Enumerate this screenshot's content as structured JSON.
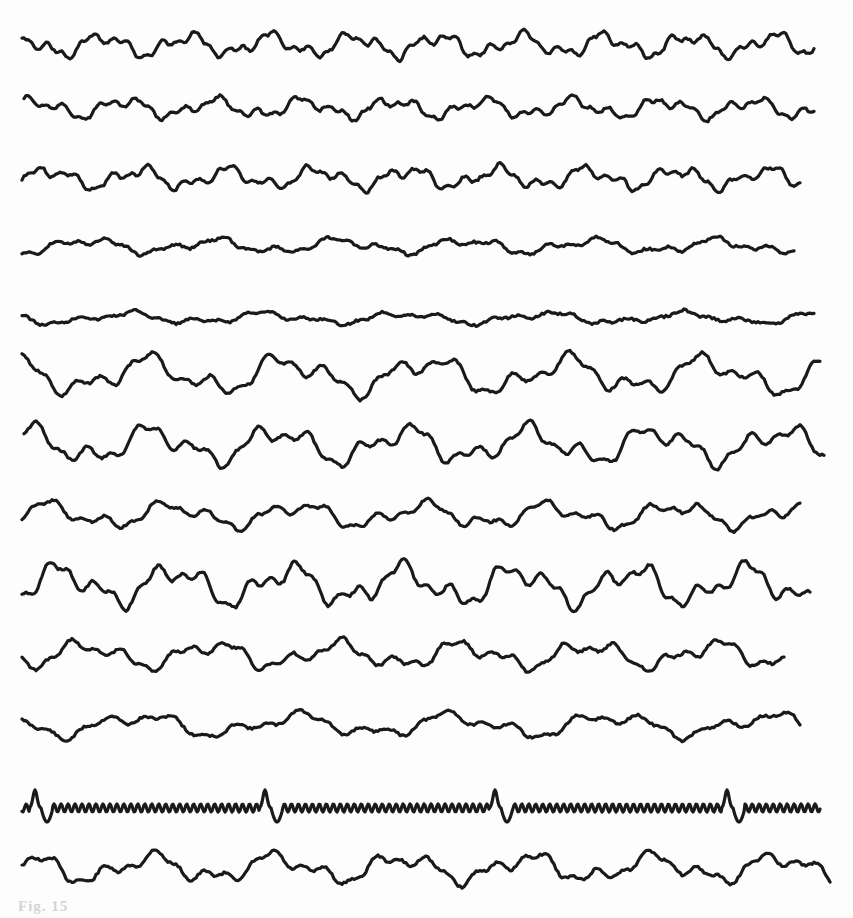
{
  "figure": {
    "caption": "Fig. 15",
    "trace_count": 13,
    "stroke_color": "#1a1a1a",
    "background_color": "#fdfdfd",
    "traces": [
      {
        "id": 1,
        "baseline": 45,
        "amp": 14,
        "seed": 1,
        "type": "eeg",
        "x_start": 22,
        "x_end": 815,
        "freq": 0.075
      },
      {
        "id": 2,
        "baseline": 108,
        "amp": 12,
        "seed": 2,
        "type": "eeg",
        "x_start": 24,
        "x_end": 815,
        "freq": 0.07
      },
      {
        "id": 3,
        "baseline": 178,
        "amp": 13,
        "seed": 3,
        "type": "eeg",
        "x_start": 22,
        "x_end": 800,
        "freq": 0.07
      },
      {
        "id": 4,
        "baseline": 246,
        "amp": 9,
        "seed": 4,
        "type": "eeg",
        "x_start": 22,
        "x_end": 795,
        "freq": 0.05
      },
      {
        "id": 5,
        "baseline": 318,
        "amp": 7,
        "seed": 5,
        "type": "eeg",
        "x_start": 22,
        "x_end": 815,
        "freq": 0.045
      },
      {
        "id": 6,
        "baseline": 375,
        "amp": 22,
        "seed": 6,
        "type": "eeg",
        "x_start": 22,
        "x_end": 820,
        "freq": 0.045
      },
      {
        "id": 7,
        "baseline": 445,
        "amp": 22,
        "seed": 7,
        "type": "eeg",
        "x_start": 24,
        "x_end": 825,
        "freq": 0.05
      },
      {
        "id": 8,
        "baseline": 515,
        "amp": 15,
        "seed": 8,
        "type": "eeg",
        "x_start": 22,
        "x_end": 800,
        "freq": 0.05
      },
      {
        "id": 9,
        "baseline": 585,
        "amp": 24,
        "seed": 9,
        "type": "eeg",
        "x_start": 22,
        "x_end": 810,
        "freq": 0.055
      },
      {
        "id": 10,
        "baseline": 655,
        "amp": 16,
        "seed": 10,
        "type": "eeg",
        "x_start": 22,
        "x_end": 785,
        "freq": 0.05
      },
      {
        "id": 11,
        "baseline": 725,
        "amp": 14,
        "seed": 11,
        "type": "eeg",
        "x_start": 22,
        "x_end": 800,
        "freq": 0.04
      },
      {
        "id": 12,
        "baseline": 808,
        "amp": 4,
        "seed": 12,
        "type": "timing",
        "x_start": 22,
        "x_end": 820,
        "markers": [
          35,
          265,
          495,
          727
        ]
      },
      {
        "id": 13,
        "baseline": 868,
        "amp": 17,
        "seed": 13,
        "type": "eeg",
        "x_start": 22,
        "x_end": 830,
        "freq": 0.05
      }
    ]
  }
}
